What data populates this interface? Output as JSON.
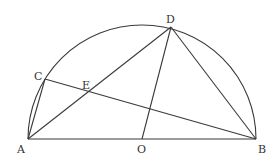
{
  "diagram": {
    "type": "geometry",
    "colors": {
      "stroke": "#3a3a3a",
      "label": "#333333",
      "background": "#ffffff"
    },
    "points": {
      "A": {
        "label": "A",
        "x": 28,
        "y": 139
      },
      "B": {
        "label": "B",
        "x": 256,
        "y": 139
      },
      "O": {
        "label": "O",
        "x": 142,
        "y": 139
      },
      "C": {
        "label": "C",
        "x": 45,
        "y": 79
      },
      "D": {
        "label": "D",
        "x": 171,
        "y": 27
      },
      "E": {
        "label": "E",
        "x": 88,
        "y": 93
      }
    },
    "segments": [
      "AB",
      "AC",
      "AD",
      "BD",
      "CB",
      "OD"
    ],
    "arc": {
      "center": "O",
      "from": "A",
      "to": "B",
      "radius": 114
    }
  }
}
